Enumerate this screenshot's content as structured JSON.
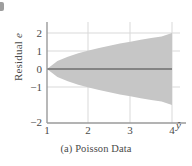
{
  "figure": {
    "caption": "(a) Poisson Data",
    "artifact_label": "page-edge-mark"
  },
  "axes": {
    "y_title_prefix": "Residual ",
    "y_title_symbol": "e",
    "x_title": "ŷ"
  },
  "colors": {
    "band_fill": "#c6c6c6",
    "zero_line": "#6e6e6e",
    "axis_line": "#9a9a9a",
    "grid_line": "#d8d8d8",
    "text": "#4a4a4a",
    "background": "#ffffff"
  },
  "chart_data": {
    "type": "area",
    "title": "(a) Poisson Data",
    "xlabel": "ŷ",
    "ylabel": "Residual e",
    "xlim": [
      1,
      4.25
    ],
    "ylim": [
      -2,
      2.35
    ],
    "xticks": [
      1,
      2,
      3,
      4
    ],
    "xtick_labels": [
      "1",
      "2",
      "3",
      "4"
    ],
    "yticks": [
      2,
      1,
      0,
      -1,
      -2
    ],
    "ytick_labels": [
      "2",
      "1",
      "0",
      "−1",
      "−2"
    ],
    "grid": true,
    "legend": "none",
    "series": [
      {
        "name": "Residual envelope (upper)",
        "x": [
          1.0,
          1.25,
          1.5,
          1.75,
          2.0,
          2.25,
          2.5,
          2.75,
          3.0,
          3.25,
          3.5,
          3.75,
          4.0
        ],
        "values": [
          0.0,
          0.44,
          0.68,
          0.87,
          1.03,
          1.17,
          1.29,
          1.41,
          1.52,
          1.62,
          1.72,
          1.81,
          2.0
        ]
      },
      {
        "name": "Residual envelope (lower)",
        "x": [
          1.0,
          1.25,
          1.5,
          1.75,
          2.0,
          2.25,
          2.5,
          2.75,
          3.0,
          3.25,
          3.5,
          3.75,
          4.0
        ],
        "values": [
          0.0,
          -0.44,
          -0.68,
          -0.87,
          -1.03,
          -1.17,
          -1.29,
          -1.41,
          -1.52,
          -1.62,
          -1.72,
          -1.81,
          -2.0
        ]
      },
      {
        "name": "Zero reference line",
        "x": [
          1.0,
          4.0
        ],
        "values": [
          0.0,
          0.0
        ]
      }
    ],
    "annotations": [
      "Megaphone / funnel-shaped residual spread increasing with fitted value",
      "Envelope widens from 0 at fitted value 1 to ±2 at fitted value 4"
    ]
  }
}
